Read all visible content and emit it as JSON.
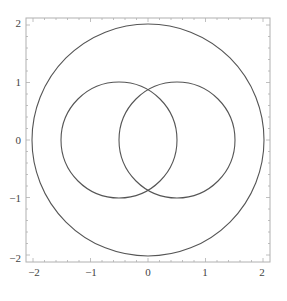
{
  "chart_data": {
    "type": "line",
    "title": "",
    "xlabel": "",
    "ylabel": "",
    "xlim": [
      -2.1,
      2.1
    ],
    "ylim": [
      -2.1,
      2.1
    ],
    "grid": false,
    "legend": null,
    "x_ticks": [
      "-2",
      "-1",
      "0",
      "1",
      "2"
    ],
    "y_ticks": [
      "-2",
      "-1",
      "0",
      "1",
      "2"
    ],
    "series": [
      {
        "name": "circle-large",
        "shape": "circle",
        "center": [
          0,
          0
        ],
        "radius": 2
      },
      {
        "name": "circle-left",
        "shape": "circle",
        "center": [
          -0.5,
          0
        ],
        "radius": 1
      },
      {
        "name": "circle-right",
        "shape": "circle",
        "center": [
          0.5,
          0
        ],
        "radius": 1
      }
    ],
    "colors": {
      "curve": "#555555",
      "frame": "#aaaaaa"
    }
  },
  "axes": {
    "x_labels": [
      "−2",
      "−1",
      "0",
      "1",
      "2"
    ],
    "y_labels": [
      "2",
      "1",
      "0",
      "−1",
      "−2"
    ]
  }
}
